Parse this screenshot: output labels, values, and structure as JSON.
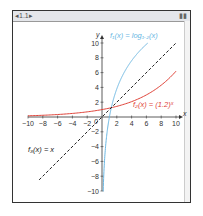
{
  "window": {
    "tab_label": "1.1",
    "battery_icon": "battery-icon"
  },
  "colors": {
    "f1": "#6ab7e3",
    "f2": "#e0443a",
    "f3": "#222222",
    "axis": "#333333"
  },
  "chart_data": {
    "type": "line",
    "title": "",
    "xlabel": "x",
    "ylabel": "y",
    "xlim": [
      -10,
      10
    ],
    "ylim": [
      -10,
      10
    ],
    "x_ticks": [
      "-10",
      "-8",
      "-6",
      "-4",
      "-2",
      "2",
      "4",
      "6",
      "8",
      "10"
    ],
    "y_ticks": [
      "10",
      "8",
      "6",
      "4",
      "2",
      "-2",
      "-4",
      "-6",
      "-8",
      "-10"
    ],
    "origin_label": "0",
    "grid": false,
    "series": [
      {
        "name": "f1(x) = log_{1.2}(x)",
        "label": "f₁(x) = log₁.₂(x)",
        "style": "solid",
        "color": "#6ab7e3",
        "x": [
          0.16,
          0.5,
          1,
          2,
          4,
          6.19
        ],
        "y": [
          -10,
          -3.8,
          0,
          3.8,
          7.6,
          10
        ]
      },
      {
        "name": "f2(x) = (1.2)^x",
        "label": "f₂(x) = (1.2)ˣ",
        "style": "solid",
        "color": "#e0443a",
        "x": [
          -10,
          -5,
          0,
          2,
          5,
          8,
          10
        ],
        "y": [
          0.16,
          0.4,
          1,
          1.44,
          2.49,
          4.3,
          6.19
        ]
      },
      {
        "name": "f3(x) = x",
        "label": "f₃(x) = x",
        "style": "dashed",
        "color": "#222222",
        "x": [
          -8.5,
          10
        ],
        "y": [
          -8.5,
          10
        ]
      }
    ]
  }
}
